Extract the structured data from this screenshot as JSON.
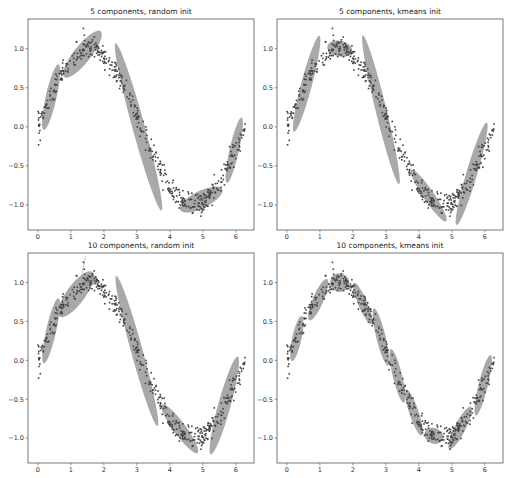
{
  "figure": {
    "width": 510,
    "height": 478,
    "ellipse_color": "#9a9a9a",
    "point_color": "#444444",
    "frame_color": "#555555"
  },
  "chart_data": [
    {
      "type": "scatter",
      "title": "5 components, random init",
      "frame": {
        "x0": 28,
        "y0": 19,
        "x1": 254,
        "y1": 230
      },
      "xlim": [
        -0.3,
        6.55
      ],
      "ylim": [
        -1.32,
        1.38
      ],
      "xticks": [
        0,
        1,
        2,
        3,
        4,
        5,
        6
      ],
      "yticks": [
        1.0,
        0.5,
        0.0,
        -0.5,
        -1.0
      ],
      "ytick_labels": [
        "1.0",
        "0.5",
        "0.0",
        "-0.5",
        "-1.0"
      ],
      "xtick_labels": [
        "0",
        "1",
        "2",
        "3",
        "4",
        "5",
        "6"
      ],
      "data_description": "Noisy samples of y = sin(x) for x in [0, 2π]",
      "ellipses": [
        {
          "cx": 0.4,
          "cy": 0.38,
          "w": 0.95,
          "h": 0.14,
          "angle": 62
        },
        {
          "cx": 1.35,
          "cy": 0.93,
          "w": 1.25,
          "h": 0.22,
          "angle": 28
        },
        {
          "cx": 3.05,
          "cy": 0.0,
          "w": 2.55,
          "h": 0.16,
          "angle": -57
        },
        {
          "cx": 4.95,
          "cy": -0.93,
          "w": 1.3,
          "h": 0.22,
          "angle": 12
        },
        {
          "cx": 5.95,
          "cy": -0.3,
          "w": 0.95,
          "h": 0.12,
          "angle": 62
        }
      ]
    },
    {
      "type": "scatter",
      "title": "5 components, kmeans init",
      "frame": {
        "x0": 277,
        "y0": 19,
        "x1": 503,
        "y1": 230
      },
      "xlim": [
        -0.3,
        6.55
      ],
      "ylim": [
        -1.32,
        1.38
      ],
      "xticks": [
        0,
        1,
        2,
        3,
        4,
        5,
        6
      ],
      "yticks": [
        1.0,
        0.5,
        0.0,
        -0.5,
        -1.0
      ],
      "ytick_labels": [
        "1.0",
        "0.5",
        "0.0",
        "-0.5",
        "-1.0"
      ],
      "xtick_labels": [
        "0",
        "1",
        "2",
        "3",
        "4",
        "5",
        "6"
      ],
      "data_description": "Noisy samples of y = sin(x) for x in [0, 2π]",
      "ellipses": [
        {
          "cx": 0.6,
          "cy": 0.55,
          "w": 1.45,
          "h": 0.14,
          "angle": 58
        },
        {
          "cx": 1.6,
          "cy": 1.0,
          "w": 0.75,
          "h": 0.2,
          "angle": -5
        },
        {
          "cx": 2.85,
          "cy": 0.22,
          "w": 2.2,
          "h": 0.14,
          "angle": -60
        },
        {
          "cx": 4.3,
          "cy": -0.88,
          "w": 1.25,
          "h": 0.14,
          "angle": -32
        },
        {
          "cx": 5.6,
          "cy": -0.6,
          "w": 1.6,
          "h": 0.14,
          "angle": 55
        }
      ]
    },
    {
      "type": "scatter",
      "title": "10 components, random init",
      "frame": {
        "x0": 28,
        "y0": 253,
        "x1": 254,
        "y1": 463
      },
      "xlim": [
        -0.3,
        6.55
      ],
      "ylim": [
        -1.32,
        1.38
      ],
      "xticks": [
        0,
        1,
        2,
        3,
        4,
        5,
        6
      ],
      "yticks": [
        1.0,
        0.5,
        0.0,
        -0.5,
        -1.0
      ],
      "ytick_labels": [
        "1.0",
        "0.5",
        "0.0",
        "-0.5",
        "-1.0"
      ],
      "xtick_labels": [
        "0",
        "1",
        "2",
        "3",
        "4",
        "5",
        "6"
      ],
      "data_description": "Noisy samples of y = sin(x) for x in [0, 2π]",
      "ellipses": [
        {
          "cx": 0.4,
          "cy": 0.38,
          "w": 0.95,
          "h": 0.13,
          "angle": 62
        },
        {
          "cx": 1.15,
          "cy": 0.85,
          "w": 1.15,
          "h": 0.24,
          "angle": 30
        },
        {
          "cx": 1.6,
          "cy": 1.02,
          "w": 0.35,
          "h": 0.12,
          "angle": 20
        },
        {
          "cx": 1.38,
          "cy": 1.2,
          "w": 0.35,
          "h": 0.005,
          "angle": 65
        },
        {
          "cx": 3.0,
          "cy": 0.12,
          "w": 2.3,
          "h": 0.15,
          "angle": -57
        },
        {
          "cx": 4.3,
          "cy": -0.88,
          "w": 1.25,
          "h": 0.16,
          "angle": -30
        },
        {
          "cx": 5.65,
          "cy": -0.58,
          "w": 1.5,
          "h": 0.16,
          "angle": 57
        }
      ]
    },
    {
      "type": "scatter",
      "title": "10 components, kmeans init",
      "frame": {
        "x0": 277,
        "y0": 253,
        "x1": 503,
        "y1": 463
      },
      "xlim": [
        -0.3,
        6.55
      ],
      "ylim": [
        -1.32,
        1.38
      ],
      "xticks": [
        0,
        1,
        2,
        3,
        4,
        5,
        6
      ],
      "yticks": [
        1.0,
        0.5,
        0.0,
        -0.5,
        -1.0
      ],
      "ytick_labels": [
        "1.0",
        "0.5",
        "0.0",
        "-0.5",
        "-1.0"
      ],
      "xtick_labels": [
        "0",
        "1",
        "2",
        "3",
        "4",
        "5",
        "6"
      ],
      "data_description": "Noisy samples of y = sin(x) for x in [0, 2π]",
      "ellipses": [
        {
          "cx": 0.3,
          "cy": 0.28,
          "w": 0.65,
          "h": 0.12,
          "angle": 63
        },
        {
          "cx": 0.95,
          "cy": 0.78,
          "w": 0.75,
          "h": 0.14,
          "angle": 45
        },
        {
          "cx": 1.6,
          "cy": 1.0,
          "w": 0.55,
          "h": 0.24,
          "angle": -10
        },
        {
          "cx": 2.3,
          "cy": 0.73,
          "w": 0.75,
          "h": 0.12,
          "angle": -45
        },
        {
          "cx": 2.85,
          "cy": 0.3,
          "w": 0.85,
          "h": 0.12,
          "angle": -60
        },
        {
          "cx": 3.35,
          "cy": -0.2,
          "w": 0.8,
          "h": 0.12,
          "angle": -60
        },
        {
          "cx": 3.85,
          "cy": -0.67,
          "w": 0.75,
          "h": 0.12,
          "angle": -52
        },
        {
          "cx": 4.45,
          "cy": -0.97,
          "w": 0.55,
          "h": 0.2,
          "angle": -10
        },
        {
          "cx": 5.25,
          "cy": -0.87,
          "w": 0.85,
          "h": 0.14,
          "angle": 40
        },
        {
          "cx": 5.95,
          "cy": -0.32,
          "w": 0.9,
          "h": 0.12,
          "angle": 60
        }
      ]
    }
  ]
}
